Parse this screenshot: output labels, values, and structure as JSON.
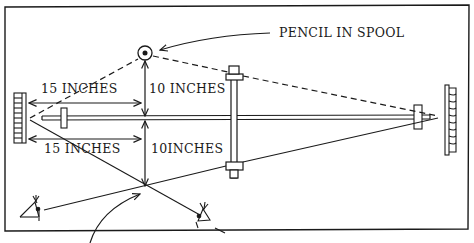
{
  "diagram": {
    "title": "",
    "labels": {
      "pencil_in_spool": "PENCIL IN SPOOL",
      "top_horizontal_distance": "15 INCHES",
      "top_vertical_distance": "10 INCHES",
      "bottom_horizontal_distance": "15 INCHES",
      "bottom_vertical_distance": "10INCHES"
    },
    "colors": {
      "ink": "#1a1a1a",
      "background": "#ffffff"
    },
    "elements": [
      "frame",
      "left-mirror",
      "right-mirror",
      "horizontal-rod",
      "vertical-post",
      "pencil-spool",
      "sight-lines",
      "observer-eyes",
      "dimension-arrows"
    ]
  }
}
